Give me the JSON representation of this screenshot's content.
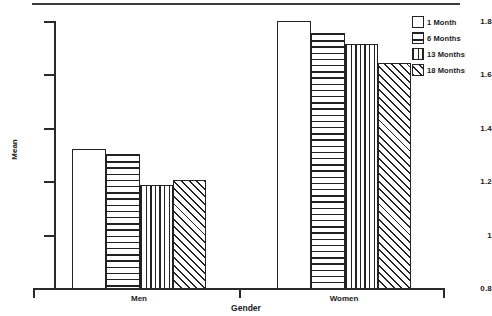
{
  "chart_data": {
    "type": "bar",
    "title": "",
    "xlabel": "Gender",
    "ylabel": "Mean",
    "categories": [
      "Men",
      "Women"
    ],
    "ylim": [
      0.8,
      1.8
    ],
    "yticks": [
      "0.8",
      "1",
      "1.2",
      "1.4",
      "1.6",
      "1.8"
    ],
    "ytick_values": [
      0.8,
      1.0,
      1.2,
      1.4,
      1.6,
      1.8
    ],
    "grid": false,
    "legend_position": "top-right",
    "series": [
      {
        "name": "1 Month",
        "pattern": "blank",
        "values": [
          1.325,
          1.8
        ]
      },
      {
        "name": "6 Months",
        "pattern": "horizontal",
        "values": [
          1.305,
          1.755
        ]
      },
      {
        "name": "13 Months",
        "pattern": "vertical",
        "values": [
          1.19,
          1.715
        ]
      },
      {
        "name": "18 Months",
        "pattern": "diagonal",
        "values": [
          1.21,
          1.645
        ]
      }
    ]
  },
  "axes": {
    "y_title": "Mean",
    "x_title": "Gender",
    "y_tick_labels": [
      "1.8",
      "1.6",
      "1.4",
      "1.2",
      "1",
      "0.8"
    ],
    "x_group_labels": [
      "Men",
      "Women"
    ]
  },
  "legend": {
    "items": [
      {
        "label": "1 Month",
        "swatch": "swatch-blank-icon"
      },
      {
        "label": "6 Months",
        "swatch": "swatch-horizontal-lines-icon"
      },
      {
        "label": "13 Months",
        "swatch": "swatch-vertical-lines-icon"
      },
      {
        "label": "18 Months",
        "swatch": "swatch-diagonal-hatch-icon"
      }
    ]
  },
  "colors": {
    "ink": "#222222",
    "background": "#ffffff",
    "axis": "#2a2a2a"
  }
}
